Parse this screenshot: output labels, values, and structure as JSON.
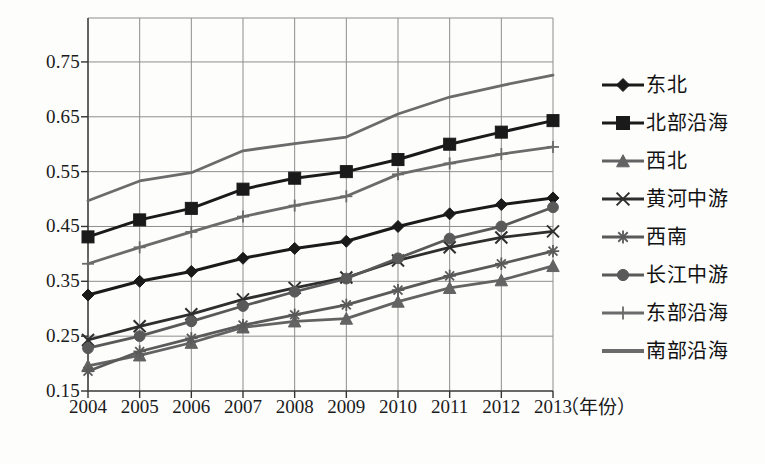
{
  "chart_data": {
    "type": "line",
    "title": "",
    "xlabel": "（年份）",
    "ylabel": "",
    "grid": true,
    "legend_position": "right",
    "x": [
      2004,
      2005,
      2006,
      2007,
      2008,
      2009,
      2010,
      2011,
      2012,
      2013
    ],
    "categories": [
      "2004",
      "2005",
      "2006",
      "2007",
      "2008",
      "2009",
      "2010",
      "2011",
      "2012",
      "2013"
    ],
    "xtick_labels": [
      "2004",
      "2005",
      "2006",
      "2007",
      "2008",
      "2009",
      "2010",
      "2011",
      "2012",
      "2013"
    ],
    "ytick_labels": [
      "0.75",
      "0.65",
      "0.55",
      "0.45",
      "0.35",
      "0.25",
      "0.15"
    ],
    "ytick_values": [
      0.75,
      0.65,
      0.55,
      0.45,
      0.35,
      0.25,
      0.15
    ],
    "ylim": [
      0.15,
      0.79
    ],
    "xlim": [
      2004,
      2013
    ],
    "series": [
      {
        "name": "东北",
        "marker": "diamond",
        "color": "#1a1a1a",
        "values": [
          0.325,
          0.35,
          0.368,
          0.392,
          0.41,
          0.423,
          0.45,
          0.473,
          0.49,
          0.502
        ]
      },
      {
        "name": "北部沿海",
        "marker": "square",
        "color": "#1a1a1a",
        "values": [
          0.431,
          0.462,
          0.483,
          0.518,
          0.538,
          0.55,
          0.572,
          0.6,
          0.622,
          0.643
        ]
      },
      {
        "name": "西北",
        "marker": "triangle",
        "color": "#636363",
        "values": [
          0.196,
          0.215,
          0.238,
          0.266,
          0.277,
          0.282,
          0.313,
          0.338,
          0.352,
          0.378
        ]
      },
      {
        "name": "黄河中游",
        "marker": "x",
        "color": "#2e2e2e",
        "values": [
          0.243,
          0.268,
          0.29,
          0.317,
          0.338,
          0.357,
          0.388,
          0.412,
          0.43,
          0.441
        ]
      },
      {
        "name": "西南",
        "marker": "asterisk",
        "color": "#5a5a5a",
        "values": [
          0.186,
          0.222,
          0.246,
          0.27,
          0.289,
          0.307,
          0.334,
          0.36,
          0.382,
          0.405
        ]
      },
      {
        "name": "长江中游",
        "marker": "circle",
        "color": "#595959",
        "values": [
          0.228,
          0.25,
          0.277,
          0.305,
          0.331,
          0.355,
          0.392,
          0.428,
          0.45,
          0.485
        ]
      },
      {
        "name": "东部沿海",
        "marker": "plus",
        "color": "#6b6b6b",
        "values": [
          0.382,
          0.412,
          0.44,
          0.468,
          0.488,
          0.505,
          0.545,
          0.565,
          0.582,
          0.595
        ]
      },
      {
        "name": "南部沿海",
        "marker": "none",
        "color": "#6b6b6b",
        "values": [
          0.497,
          0.533,
          0.548,
          0.588,
          0.601,
          0.613,
          0.655,
          0.686,
          0.707,
          0.726
        ]
      }
    ]
  },
  "axis": {
    "x_title": "（年份）"
  }
}
